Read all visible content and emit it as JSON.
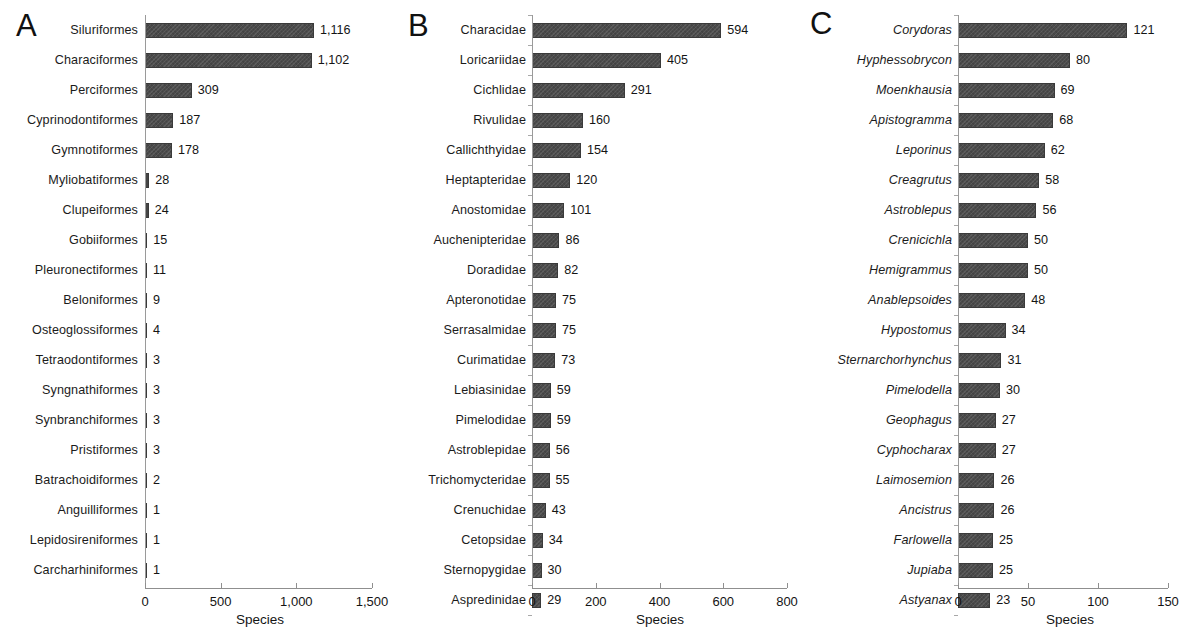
{
  "figure": {
    "background": "#ffffff",
    "bar_color": "#4b4b4b",
    "axis_color": "#8f8f8f"
  },
  "chart_data": [
    {
      "type": "bar",
      "panel": "A",
      "orientation": "horizontal",
      "title": "",
      "xlabel": "Species",
      "ylabel": "",
      "xlim": [
        0,
        1500
      ],
      "xticks": [
        0,
        500,
        1000,
        1500
      ],
      "xtick_labels": [
        "0",
        "500",
        "1,000",
        "1,500"
      ],
      "grid": false,
      "legend": "none",
      "label_style": "normal",
      "categories": [
        "Siluriformes",
        "Characiformes",
        "Perciformes",
        "Cyprinodontiformes",
        "Gymnotiformes",
        "Myliobatiformes",
        "Clupeiformes",
        "Gobiiformes",
        "Pleuronectiformes",
        "Beloniformes",
        "Osteoglossiformes",
        "Tetraodontiformes",
        "Syngnathiformes",
        "Synbranchiformes",
        "Pristiformes",
        "Batrachoidiformes",
        "Anguilliformes",
        "Lepidosireniformes",
        "Carcharhiniformes"
      ],
      "values": [
        1116,
        1102,
        309,
        187,
        178,
        28,
        24,
        15,
        11,
        9,
        4,
        3,
        3,
        3,
        3,
        2,
        1,
        1,
        1
      ],
      "value_labels": [
        "1,116",
        "1,102",
        "309",
        "187",
        "178",
        "28",
        "24",
        "15",
        "11",
        "9",
        "4",
        "3",
        "3",
        "3",
        "3",
        "2",
        "1",
        "1",
        "1"
      ]
    },
    {
      "type": "bar",
      "panel": "B",
      "orientation": "horizontal",
      "title": "",
      "xlabel": "Species",
      "ylabel": "",
      "xlim": [
        0,
        800
      ],
      "xticks": [
        0,
        200,
        400,
        600,
        800
      ],
      "xtick_labels": [
        "0",
        "200",
        "400",
        "600",
        "800"
      ],
      "grid": false,
      "legend": "none",
      "label_style": "normal",
      "categories": [
        "Characidae",
        "Loricariidae",
        "Cichlidae",
        "Rivulidae",
        "Callichthyidae",
        "Heptapteridae",
        "Anostomidae",
        "Auchenipteridae",
        "Doradidae",
        "Apteronotidae",
        "Serrasalmidae",
        "Curimatidae",
        "Lebiasinidae",
        "Pimelodidae",
        "Astroblepidae",
        "Trichomycteridae",
        "Crenuchidae",
        "Cetopsidae",
        "Sternopygidae",
        "Aspredinidae"
      ],
      "values": [
        594,
        405,
        291,
        160,
        154,
        120,
        101,
        86,
        82,
        75,
        75,
        73,
        59,
        59,
        56,
        55,
        43,
        34,
        30,
        29
      ],
      "value_labels": [
        "594",
        "405",
        "291",
        "160",
        "154",
        "120",
        "101",
        "86",
        "82",
        "75",
        "75",
        "73",
        "59",
        "59",
        "56",
        "55",
        "43",
        "34",
        "30",
        "29"
      ]
    },
    {
      "type": "bar",
      "panel": "C",
      "orientation": "horizontal",
      "title": "",
      "xlabel": "Species",
      "ylabel": "",
      "xlim": [
        0,
        150
      ],
      "xticks": [
        0,
        50,
        100,
        150
      ],
      "xtick_labels": [
        "0",
        "50",
        "100",
        "150"
      ],
      "grid": false,
      "legend": "none",
      "label_style": "italic",
      "categories": [
        "Corydoras",
        "Hyphessobrycon",
        "Moenkhausia",
        "Apistogramma",
        "Leporinus",
        "Creagrutus",
        "Astroblepus",
        "Crenicichla",
        "Hemigrammus",
        "Anablepsoides",
        "Hypostomus",
        "Sternarchorhynchus",
        "Pimelodella",
        "Geophagus",
        "Cyphocharax",
        "Laimosemion",
        "Ancistrus",
        "Farlowella",
        "Jupiaba",
        "Astyanax"
      ],
      "values": [
        121,
        80,
        69,
        68,
        62,
        58,
        56,
        50,
        50,
        48,
        34,
        31,
        30,
        27,
        27,
        26,
        26,
        25,
        25,
        23
      ],
      "value_labels": [
        "121",
        "80",
        "69",
        "68",
        "62",
        "58",
        "56",
        "50",
        "50",
        "48",
        "34",
        "31",
        "30",
        "27",
        "27",
        "26",
        "26",
        "25",
        "25",
        "23"
      ]
    }
  ],
  "panels": [
    {
      "letter": "A"
    },
    {
      "letter": "B"
    },
    {
      "letter": "C"
    }
  ]
}
